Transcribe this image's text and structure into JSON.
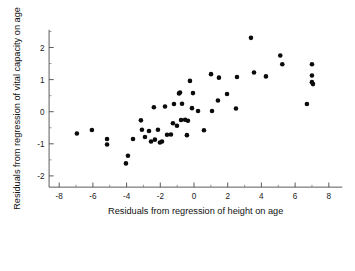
{
  "chart_data": {
    "type": "scatter",
    "title": "",
    "xlabel": "Residuals from regression of height on age",
    "ylabel": "Residuals from regression of vital capacity on age",
    "xlim": [
      -8.6,
      8.8
    ],
    "ylim": [
      -2.35,
      2.55
    ],
    "xticks": [
      -8,
      -6,
      -4,
      -2,
      0,
      2,
      4,
      6,
      8
    ],
    "yticks": [
      -2,
      -1,
      0,
      1,
      2
    ],
    "xticklabels": [
      "-8",
      "-6",
      "-4",
      "-2",
      "0",
      "2",
      "4",
      "6",
      "8"
    ],
    "yticklabels": [
      "-2",
      "-1",
      "0",
      "1",
      "2"
    ],
    "x_minor_step": 1,
    "y_minor_step": 0.5,
    "grid": false,
    "legend": null,
    "marker": "filled-circle",
    "marker_color": "#0b0b0b",
    "marker_size": 2.3,
    "n_points": 52,
    "points": [
      [
        -6.95,
        -0.68
      ],
      [
        -6.06,
        -0.57
      ],
      [
        -5.16,
        -0.85
      ],
      [
        -5.16,
        -1.02
      ],
      [
        -4.04,
        -1.61
      ],
      [
        -3.92,
        -1.37
      ],
      [
        -3.62,
        -0.85
      ],
      [
        -3.15,
        -0.27
      ],
      [
        -3.09,
        -0.56
      ],
      [
        -2.91,
        -0.79
      ],
      [
        -2.55,
        -0.93
      ],
      [
        -2.38,
        0.14
      ],
      [
        -2.32,
        -0.87
      ],
      [
        -2.14,
        -0.56
      ],
      [
        -2.02,
        -0.96
      ],
      [
        -1.9,
        -0.93
      ],
      [
        -1.72,
        0.16
      ],
      [
        -1.6,
        -0.72
      ],
      [
        -1.37,
        -0.71
      ],
      [
        -1.19,
        0.24
      ],
      [
        -1.01,
        -0.44
      ],
      [
        -0.89,
        0.57
      ],
      [
        -0.83,
        0.6
      ],
      [
        -0.77,
        -0.26
      ],
      [
        -0.71,
        0.25
      ],
      [
        -0.53,
        -0.25
      ],
      [
        -0.42,
        -0.73
      ],
      [
        -0.36,
        -0.28
      ],
      [
        -0.24,
        0.96
      ],
      [
        -0.12,
        0.11
      ],
      [
        0.24,
        0.02
      ],
      [
        0.59,
        -0.58
      ],
      [
        1.01,
        1.17
      ],
      [
        1.07,
        0.02
      ],
      [
        1.42,
        0.35
      ],
      [
        1.48,
        1.06
      ],
      [
        1.96,
        0.55
      ],
      [
        2.49,
        0.1
      ],
      [
        2.55,
        1.08
      ],
      [
        3.38,
        2.3
      ],
      [
        3.56,
        1.22
      ],
      [
        5.12,
        1.75
      ],
      [
        5.24,
        1.48
      ],
      [
        6.7,
        0.24
      ],
      [
        7.0,
        1.48
      ],
      [
        7.0,
        1.13
      ],
      [
        7.0,
        0.92
      ],
      [
        7.06,
        0.86
      ],
      [
        -2.67,
        -0.6
      ],
      [
        -1.25,
        -0.36
      ],
      [
        -0.06,
        0.58
      ],
      [
        4.27,
        1.1
      ]
    ]
  },
  "axes": {
    "x_axis_name": "x-axis",
    "y_axis_name": "y-axis"
  }
}
